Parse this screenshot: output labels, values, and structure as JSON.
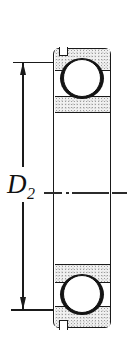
{
  "diagram": {
    "type": "bearing-cross-section-drawing",
    "dimension": {
      "label_main": "D",
      "label_sub": "2"
    },
    "parts": {
      "outer_ring_top": "outer ring section (stippled)",
      "inner_ring_top": "inner ring section (stippled)",
      "inner_ring_bottom": "inner ring section (stippled)",
      "outer_ring_bottom": "outer ring section (stippled)",
      "ball_top": "rolling ball",
      "ball_bottom": "rolling ball",
      "snap_ring_groove": "notch in outer ring left side"
    },
    "colors": {
      "line": "#1a1a1a",
      "background": "#ffffff",
      "stipple_bg": "#f1f1f1",
      "stipple_dot": "#9d9d9d"
    }
  }
}
